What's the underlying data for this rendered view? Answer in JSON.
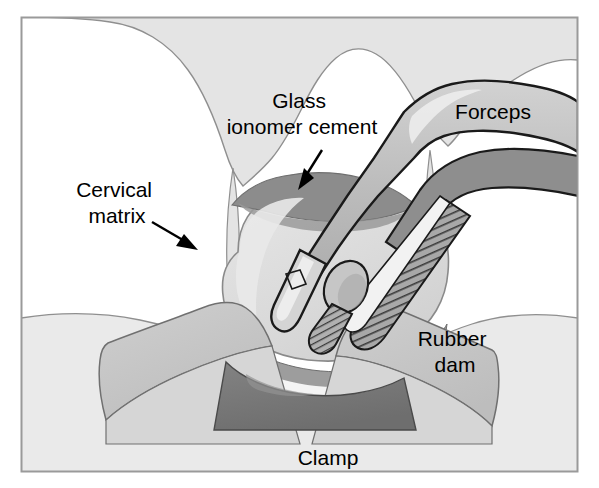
{
  "figure": {
    "frame": {
      "border_color": "#9a9a9a",
      "background_color": "#ffffff"
    },
    "palette": {
      "gingiva": "#e4e4e4",
      "gingiva_outline": "#8f8f8f",
      "tooth": "#dcdcdc",
      "tooth_outline": "#8a8a8a",
      "cement": "#8c8c8c",
      "cement_outline": "#6f6f6f",
      "rubber_dam": "#c9c9c9",
      "rubber_dam_outline": "#707070",
      "rubber_dam_lower": "#d8d8d8",
      "clamp": "#7a7a7a",
      "clamp_outline": "#4a4a4a",
      "forceps_body": "#bcbcbc",
      "forceps_dark": "#8e8e8e",
      "forceps_outline": "#1a1a1a",
      "forceps_highlight": "#efefef",
      "hatch_stroke": "#3a3a3a",
      "arrow_color": "#000000",
      "label_color": "#000000"
    },
    "labels": [
      {
        "id": "glass-ionomer-cement",
        "lines": [
          "Glass",
          "ionomer cement"
        ],
        "x": 302,
        "y": 110,
        "leader": {
          "from": [
            322,
            150
          ],
          "to": [
            300,
            186
          ]
        }
      },
      {
        "id": "forceps",
        "lines": [
          "Forceps"
        ],
        "x": 493,
        "y": 113,
        "leader": null
      },
      {
        "id": "cervical-matrix",
        "lines": [
          "Cervical",
          "matrix"
        ],
        "x": 117,
        "y": 200,
        "leader": {
          "from": [
            152,
            224
          ],
          "to": [
            196,
            249
          ]
        }
      },
      {
        "id": "rubber-dam",
        "lines": [
          "Rubber",
          "dam"
        ],
        "x": 455,
        "y": 350,
        "leader": null
      },
      {
        "id": "clamp",
        "lines": [
          "Clamp"
        ],
        "x": 328,
        "y": 459,
        "leader": null
      }
    ]
  }
}
